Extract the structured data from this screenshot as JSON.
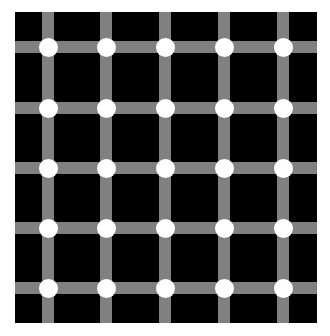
{
  "illusion": {
    "name": "Scintillating grid",
    "colors": {
      "background": "#000000",
      "bars": "#808080",
      "dots": "#ffffff",
      "page": "#ffffff"
    },
    "columns_x": [
      48,
      106,
      165,
      224,
      283
    ],
    "rows_y": [
      47,
      108,
      168,
      228,
      288
    ],
    "bar_width": 12,
    "dot_diameter": 19
  }
}
